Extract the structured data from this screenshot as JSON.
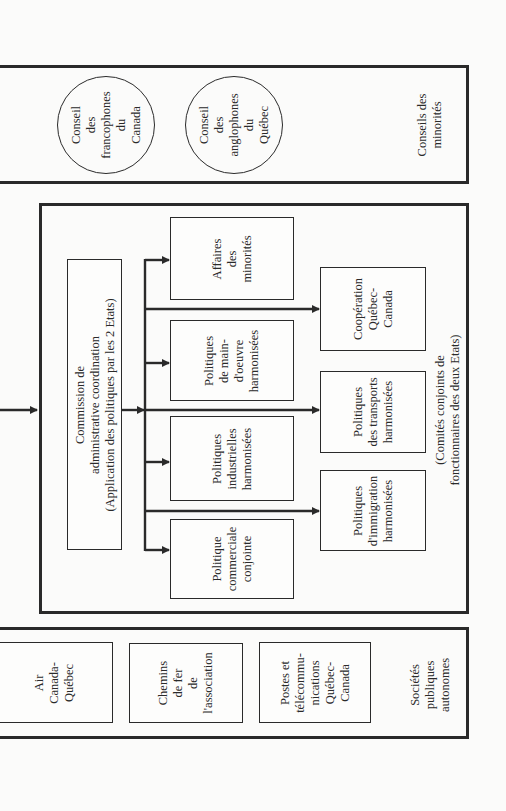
{
  "diagram": {
    "orientation": "rotated-90-ccw",
    "minorities": {
      "label": "Conseils des\nminorités",
      "councils": [
        {
          "label": "Conseil\ndes\nfrancophones\ndu\nCanada"
        },
        {
          "label": "Conseil\ndes\nanglophones\ndu\nQuébec"
        }
      ]
    },
    "committees": {
      "label": "(Comités conjoints de\nfonctionnaires des deux Etats)",
      "commission": "Commission de\nadministrative coordination\n(Application des politiques par les 2 Etats)",
      "policies_inner": [
        {
          "label": "Affaires\ndes\nminorités"
        },
        {
          "label": "Politiques\nde main-\nd'oeuvre\nharmonisées"
        },
        {
          "label": "Politiques\nindustrielles\nharmonisées"
        },
        {
          "label": "Politique\ncommerciale\nconjointe"
        }
      ],
      "policies_outer": [
        {
          "label": "Coopération\nQuébec-\nCanada"
        },
        {
          "label": "Politiques\ndes transports\nharmonisées"
        },
        {
          "label": "Politiques\nd'immigration\nharmonisées"
        }
      ]
    },
    "public_companies": {
      "label": "Sociétés\npubliques\nautonomes",
      "items": [
        {
          "label": "Air\nCanada-\nQuébec"
        },
        {
          "label": "Chemins\nde fer\nde\nl'association"
        },
        {
          "label": "Postes et\ntélécommu-\nnications\nQuébec-\nCanada"
        }
      ]
    }
  }
}
